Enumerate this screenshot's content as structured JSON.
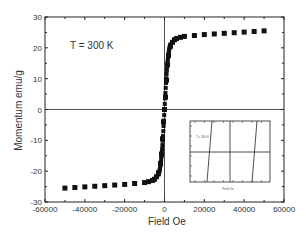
{
  "chart_data": {
    "type": "scatter",
    "title": "",
    "annotation": "T = 300 K",
    "xlabel": "Field Oe",
    "ylabel": "Momentum emu/g",
    "xlim": [
      -60000,
      60000
    ],
    "ylim": [
      -30,
      30
    ],
    "xticks": [
      "-60000",
      "-40000",
      "-20000",
      "0",
      "20000",
      "40000",
      "60000"
    ],
    "yticks": [
      "30",
      "20",
      "10",
      "0",
      "-10",
      "-20",
      "-30"
    ],
    "grid": false,
    "legend": null,
    "series": [
      {
        "name": "M(H) at 300 K",
        "marker": "square",
        "x": [
          -50000,
          -45000,
          -40000,
          -35000,
          -30000,
          -25000,
          -20000,
          -15000,
          -10000,
          -8000,
          -6000,
          -5000,
          -4000,
          -3000,
          -2000,
          -1500,
          -1000,
          -500,
          0,
          500,
          1000,
          1500,
          2000,
          3000,
          4000,
          5000,
          6000,
          8000,
          10000,
          15000,
          20000,
          25000,
          30000,
          35000,
          40000,
          45000,
          50000
        ],
        "y": [
          -25.5,
          -25.3,
          -25.1,
          -24.9,
          -24.7,
          -24.5,
          -24.3,
          -24.0,
          -23.7,
          -23.4,
          -23.0,
          -22.6,
          -21.8,
          -20.5,
          -17.5,
          -14.5,
          -9.5,
          -4,
          0,
          4,
          9.5,
          14.5,
          17.5,
          20.5,
          21.8,
          22.6,
          23.0,
          23.4,
          23.7,
          24.0,
          24.3,
          24.5,
          24.7,
          24.9,
          25.1,
          25.3,
          25.5
        ]
      }
    ],
    "inset": {
      "description": "zoomed low-field hysteresis loop",
      "annotation": "T = 300 K",
      "xlabel": "Field Oe",
      "ylabel": "Momentum emu/g"
    }
  }
}
